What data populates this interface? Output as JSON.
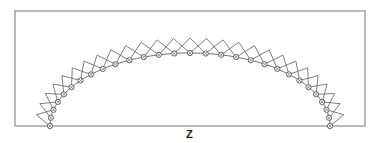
{
  "diagram": {
    "type": "arch-truss",
    "axis_label": "Z",
    "frame": {
      "x": 15,
      "y": 11,
      "width": 350,
      "height": 115
    },
    "arch": {
      "left_support": [
        50,
        126
      ],
      "right_support": [
        330,
        126
      ],
      "crown": [
        190,
        53
      ]
    },
    "node_count": 29,
    "colors": {
      "frame": "#a8a8a8",
      "members": "#707070",
      "nodes": "#555555",
      "background": "#ffffff"
    }
  }
}
